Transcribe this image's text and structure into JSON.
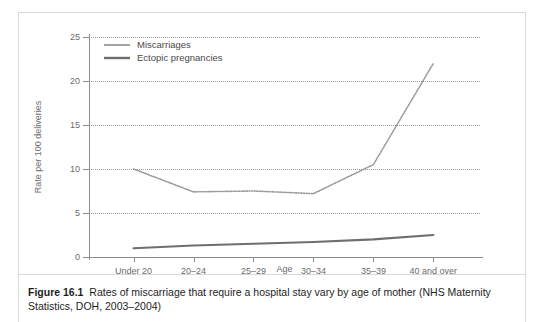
{
  "figure": {
    "caption_label": "Figure 16.1",
    "caption_text": "Rates of miscarriage that require a hospital stay vary by age of mother (NHS Maternity Statistics, DOH, 2003–2004)"
  },
  "legend": {
    "position": "top-left",
    "items": [
      {
        "label": "Miscarriages",
        "style": "dotted",
        "color": "#9a9a9a"
      },
      {
        "label": "Ectopic pregnancies",
        "style": "solid",
        "color": "#6e6e6e"
      }
    ]
  },
  "chart_data": {
    "type": "line",
    "title": "",
    "xlabel": "Age",
    "ylabel": "Rate per 100 deliveries",
    "categories": [
      "Under 20",
      "20–24",
      "25–29",
      "30–34",
      "35–39",
      "40 and over"
    ],
    "series": [
      {
        "name": "Miscarriages",
        "style": "dotted",
        "color": "#9a9a9a",
        "values": [
          10.0,
          7.4,
          7.5,
          7.2,
          10.5,
          22.0
        ]
      },
      {
        "name": "Ectopic pregnancies",
        "style": "solid",
        "color": "#6e6e6e",
        "values": [
          1.0,
          1.3,
          1.5,
          1.7,
          2.0,
          2.5
        ]
      }
    ],
    "ylim": [
      0,
      25
    ],
    "yticks": [
      0,
      5,
      10,
      15,
      20,
      25
    ],
    "ytick_labels": [
      "0",
      "5",
      "10",
      "15",
      "20",
      "25"
    ],
    "grid": true,
    "grid_style": "dotted",
    "grid_color": "#9a9a9a"
  }
}
